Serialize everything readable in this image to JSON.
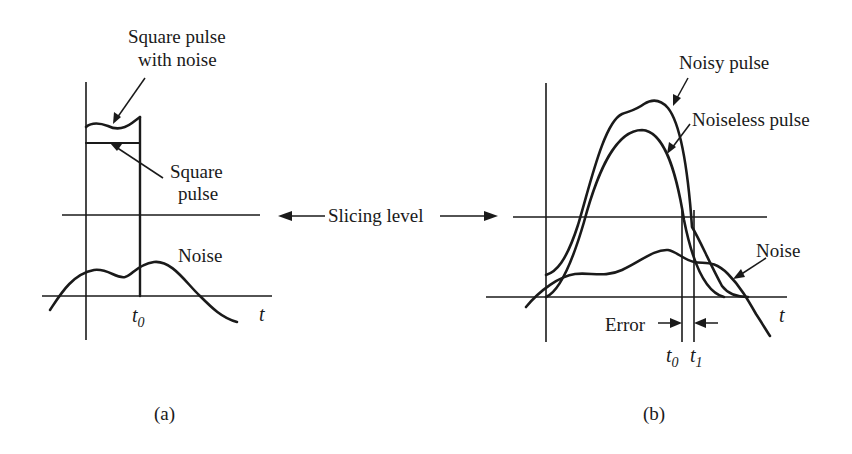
{
  "panel_a": {
    "caption": "(a)",
    "labels": {
      "square_pulse_with_noise_line1": "Square pulse",
      "square_pulse_with_noise_line2": "with noise",
      "square_pulse_line1": "Square",
      "square_pulse_line2": "pulse",
      "noise": "Noise",
      "t0_base": "t",
      "t0_sub": "0",
      "t_axis": "t"
    }
  },
  "shared": {
    "slicing_level": "Slicing level"
  },
  "panel_b": {
    "caption": "(b)",
    "labels": {
      "noisy_pulse": "Noisy pulse",
      "noiseless_pulse": "Noiseless pulse",
      "noise": "Noise",
      "error": "Error",
      "t0_base": "t",
      "t0_sub": "0",
      "t1_base": "t",
      "t1_sub": "1",
      "t_axis": "t"
    }
  },
  "colors": {
    "ink": "#1a1a1a",
    "background": "#ffffff"
  }
}
